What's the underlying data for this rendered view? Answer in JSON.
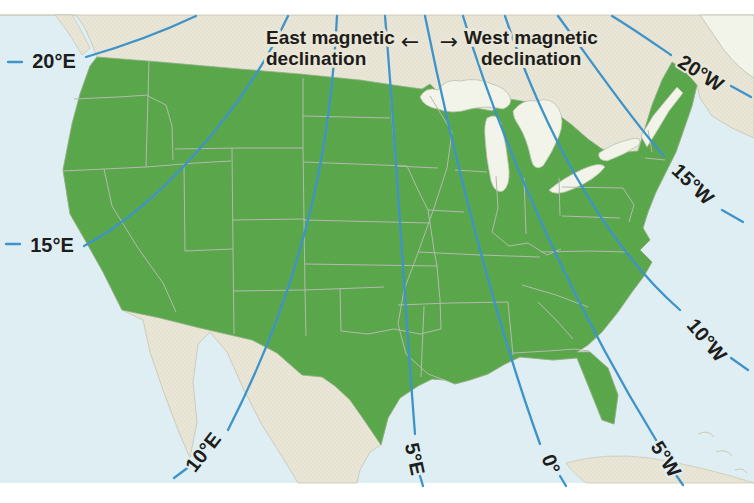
{
  "figure": {
    "type": "United States magnetic declination (isogonic) map",
    "legend": {
      "east_line1": "East magnetic",
      "east_line2": "declination",
      "west_line1": "West magnetic",
      "west_line2": "declination",
      "left_arrow": "←",
      "right_arrow": "→"
    },
    "isogonic_lines": [
      {
        "id": "20E",
        "label": "20°E"
      },
      {
        "id": "15E",
        "label": "15°E"
      },
      {
        "id": "10E",
        "label": "10°E"
      },
      {
        "id": "5E",
        "label": "5°E"
      },
      {
        "id": "0",
        "label": "0°"
      },
      {
        "id": "5W",
        "label": "5°W"
      },
      {
        "id": "10W",
        "label": "10°W"
      },
      {
        "id": "15W",
        "label": "15°W"
      },
      {
        "id": "20W",
        "label": "20°W"
      }
    ],
    "colors": {
      "us_land": "#5ba84c",
      "other_land": "#e9e6d7",
      "ocean": "#dfeef2",
      "lakes": "#f2f4ea",
      "isogonic_line": "#3e93c9",
      "state_border": "#b3bab0",
      "label_text": "#1d1d1b"
    }
  }
}
